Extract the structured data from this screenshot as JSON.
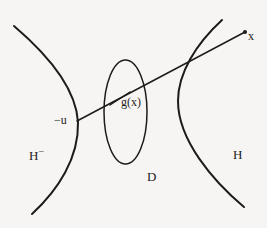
{
  "figure": {
    "name": "hyperbola-half-spaces-diagram",
    "background_color": "#f6f5f3",
    "ink_color": "#1d1c1b",
    "width": 267,
    "height": 228,
    "labels": {
      "left_region": "H",
      "left_region_superscript": "−",
      "right_region": "H",
      "disk_region": "D",
      "map_value": "g(x)",
      "point_x": "x",
      "point_minus_u": "−u"
    },
    "elements": {
      "left_curve_name": "left-hyperbola-branch",
      "right_curve_name": "right-hyperbola-branch",
      "ellipse_name": "disk-ellipse",
      "geodesic_name": "geodesic-line",
      "tick_name": "gx-pointer-tick",
      "endpoint_name": "x-endpoint-dot"
    },
    "geometry": {
      "left_curve_path": "M 14 26 C 48 55, 76 88, 78 122 C 79 158, 58 190, 32 214",
      "right_curve_path": "M 222 20 C 196 44, 178 73, 178 101 C 178 140, 213 181, 244 207",
      "ellipse_cx": 125.5,
      "ellipse_cy": 112,
      "ellipse_rx": 21.5,
      "ellipse_ry": 52,
      "geodesic_x1": 77,
      "geodesic_y1": 121,
      "geodesic_x2": 245,
      "geodesic_y2": 32,
      "tick_x1": 110,
      "tick_y1": 105,
      "tick_x2": 130,
      "tick_y2": 92,
      "endpoint_cx": 245,
      "endpoint_cy": 32,
      "endpoint_r": 2
    }
  }
}
